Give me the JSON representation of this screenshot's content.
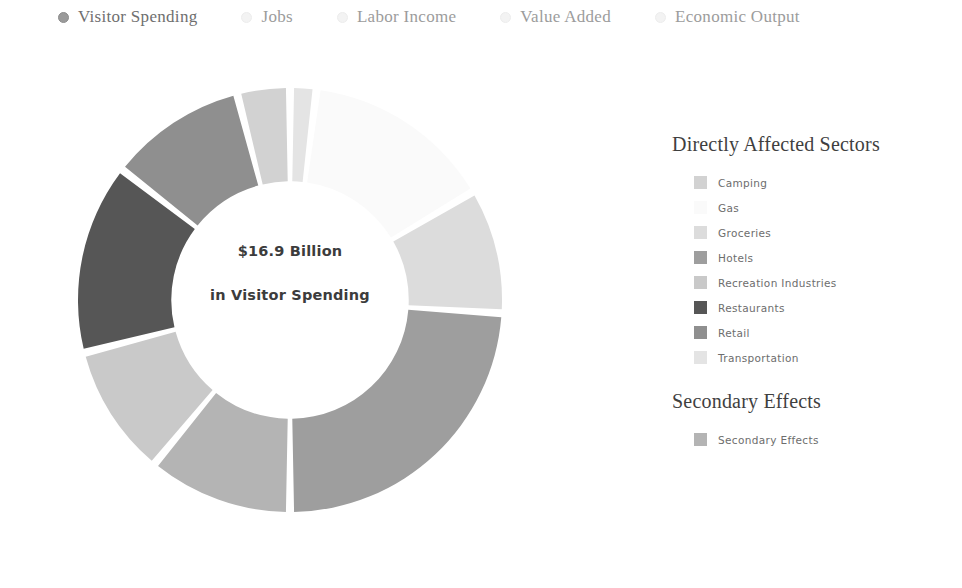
{
  "tabs": [
    {
      "label": "Visitor Spending",
      "selected": true,
      "icon": "radio-filled-icon"
    },
    {
      "label": "Jobs",
      "selected": false,
      "icon": "radio-empty-icon"
    },
    {
      "label": "Labor Income",
      "selected": false,
      "icon": "radio-empty-icon"
    },
    {
      "label": "Value Added",
      "selected": false,
      "icon": "radio-empty-icon"
    },
    {
      "label": "Economic Output",
      "selected": false,
      "icon": "radio-empty-icon"
    }
  ],
  "center": {
    "amount": "$16.9 Billion",
    "caption": "in Visitor Spending"
  },
  "legend": {
    "primary_heading": "Directly Affected Sectors",
    "primary_items": [
      {
        "label": "Camping",
        "color": "#d2d2d2"
      },
      {
        "label": "Gas",
        "color": "#fafafa"
      },
      {
        "label": "Groceries",
        "color": "#dcdcdc"
      },
      {
        "label": "Hotels",
        "color": "#9e9e9e"
      },
      {
        "label": "Recreation Industries",
        "color": "#c9c9c9"
      },
      {
        "label": "Restaurants",
        "color": "#565656"
      },
      {
        "label": "Retail",
        "color": "#8f8f8f"
      },
      {
        "label": "Transportation",
        "color": "#e4e4e4"
      }
    ],
    "secondary_heading": "Secondary Effects",
    "secondary_items": [
      {
        "label": "Secondary Effects",
        "color": "#b4b4b4"
      }
    ]
  },
  "chart_data": {
    "type": "pie",
    "title": "$16.9 Billion in Visitor Spending",
    "subtitle": "Directly Affected Sectors and Secondary Effects",
    "unit": "percent of total visitor spending",
    "total_label": "$16.9 Billion",
    "donut": true,
    "inner_radius_ratio": 0.56,
    "start_angle_deg": 0,
    "legend_position": "right",
    "grid": false,
    "categories": [
      "Transportation",
      "Gas",
      "Groceries",
      "Hotels",
      "Secondary Effects",
      "Recreation Industries",
      "Restaurants",
      "Retail",
      "Camping"
    ],
    "values": [
      2.0,
      14.5,
      9.5,
      24.0,
      11.0,
      10.0,
      14.5,
      10.5,
      4.0
    ],
    "colors": [
      "#e4e4e4",
      "#fafafa",
      "#dcdcdc",
      "#9e9e9e",
      "#b4b4b4",
      "#c9c9c9",
      "#565656",
      "#8f8f8f",
      "#d2d2d2"
    ],
    "slice_order_clockwise_from_12oclock": true,
    "xlabel": "",
    "ylabel": ""
  }
}
